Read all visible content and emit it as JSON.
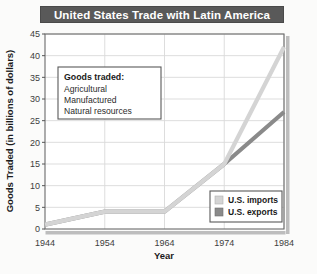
{
  "chart_data": {
    "type": "line",
    "title": "United States Trade with Latin America",
    "xlabel": "Year",
    "ylabel": "Goods Traded (in billions of dollars)",
    "x": [
      1944,
      1954,
      1964,
      1974,
      1984
    ],
    "xticklabels": [
      "1944",
      "1954",
      "1964",
      "1974",
      "1984"
    ],
    "yticks": [
      0,
      5,
      10,
      15,
      20,
      25,
      30,
      35,
      40,
      45
    ],
    "yticklabels": [
      "0",
      "5",
      "10",
      "15",
      "20",
      "25",
      "30",
      "35",
      "40",
      "45"
    ],
    "ylim": [
      0,
      45
    ],
    "xlim": [
      1944,
      1984
    ],
    "grid": true,
    "legend_position": "lower right",
    "series": [
      {
        "name": "U.S. imports",
        "color": "#d4d4d4",
        "values": [
          1,
          4,
          4,
          15,
          42
        ]
      },
      {
        "name": "U.S. exports",
        "color": "#8a8a8a",
        "values": [
          1,
          4,
          4,
          15,
          27
        ]
      }
    ],
    "annotation": {
      "heading": "Goods traded:",
      "items": [
        "Agricultural",
        "Manufactured",
        "Natural resources"
      ]
    }
  },
  "colors": {
    "title_bar_bg": "#595959",
    "title_text": "#ffffff",
    "plot_bg": "#ffffff",
    "grid": "#d9d9d9",
    "axis": "#555555",
    "page_bg": "#fbfbfa"
  }
}
